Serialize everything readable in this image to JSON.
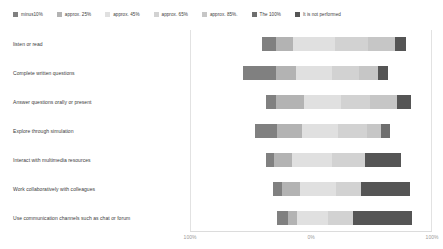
{
  "legend": {
    "items": [
      {
        "label": "minus10%",
        "color": "#808080"
      },
      {
        "label": "approx. 25%",
        "color": "#b3b3b3"
      },
      {
        "label": "approx. 45%",
        "color": "#e0e0e0"
      },
      {
        "label": "approx. 65%",
        "color": "#d2d2d2"
      },
      {
        "label": "approx. 85%.",
        "color": "#c6c6c6"
      },
      {
        "label": "The 100%",
        "color": "#6e6e6e"
      },
      {
        "label": "It is not performed",
        "color": "#555555"
      }
    ]
  },
  "axis": {
    "ticks": [
      {
        "label": "100%",
        "x": 190
      },
      {
        "label": "0%",
        "x": 311
      },
      {
        "label": "100%",
        "x": 432
      }
    ]
  },
  "chart_data": {
    "type": "bar",
    "subtype": "diverging-stacked-bar",
    "orientation": "horizontal",
    "title": "",
    "xlabel": "",
    "ylabel": "",
    "xlim": [
      -100,
      100
    ],
    "grid": false,
    "legend_position": "top",
    "categories": [
      "listen or read",
      "Complete written questions",
      "Answer questions orally or present",
      "Explore through simulation",
      "Interact with multimedia resources",
      "Work collaboratively with colleagues",
      "Use communication channels such as chat or forum"
    ],
    "series": [
      {
        "name": "minus10%",
        "color": "#808080",
        "values": [
          7,
          17,
          5,
          11,
          4,
          5,
          6
        ]
      },
      {
        "name": "approx. 25%",
        "color": "#b3b3b3",
        "values": [
          9,
          10,
          15,
          13,
          9,
          9,
          4
        ]
      },
      {
        "name": "approx. 45%",
        "color": "#e0e0e0",
        "values": [
          22,
          19,
          19,
          18,
          21,
          18,
          14
        ]
      },
      {
        "name": "approx. 65%",
        "color": "#d2d2d2",
        "values": [
          17,
          14,
          15,
          15,
          17,
          14,
          13
        ]
      },
      {
        "name": "approx. 85%.",
        "color": "#c6c6c6",
        "values": [
          14,
          10,
          14,
          12,
          13,
          10,
          10
        ]
      },
      {
        "name": "The 100%",
        "color": "#6e6e6e",
        "values": [
          5,
          5,
          7,
          3,
          0,
          0,
          0
        ]
      },
      {
        "name": "It is not performed",
        "color": "#555555",
        "values": [
          4,
          2,
          7,
          6,
          19,
          27,
          33
        ]
      }
    ],
    "rows": [
      {
        "category": "listen or read",
        "segments": [
          {
            "name": "minus10%",
            "color": "#808080",
            "width": 14
          },
          {
            "name": "approx. 25%",
            "color": "#b3b3b3",
            "width": 17
          },
          {
            "name": "approx. 45%",
            "color": "#e0e0e0",
            "width": 42
          },
          {
            "name": "approx. 65%",
            "color": "#d2d2d2",
            "width": 33
          },
          {
            "name": "approx. 85%.",
            "color": "#c6c6c6",
            "width": 27
          },
          {
            "name": "It is not performed",
            "color": "#555555",
            "width": 11
          }
        ],
        "offset": 72
      },
      {
        "category": "Complete written questions",
        "segments": [
          {
            "name": "minus10%",
            "color": "#808080",
            "width": 33
          },
          {
            "name": "approx. 25%",
            "color": "#b3b3b3",
            "width": 20
          },
          {
            "name": "approx. 45%",
            "color": "#e0e0e0",
            "width": 36
          },
          {
            "name": "approx. 65%",
            "color": "#d2d2d2",
            "width": 27
          },
          {
            "name": "approx. 85%.",
            "color": "#c6c6c6",
            "width": 19
          },
          {
            "name": "It is not performed",
            "color": "#555555",
            "width": 10
          }
        ],
        "offset": 53
      },
      {
        "category": "Answer questions orally or present",
        "segments": [
          {
            "name": "minus10%",
            "color": "#808080",
            "width": 10
          },
          {
            "name": "approx. 25%",
            "color": "#b3b3b3",
            "width": 28
          },
          {
            "name": "approx. 45%",
            "color": "#e0e0e0",
            "width": 37
          },
          {
            "name": "approx. 65%",
            "color": "#d2d2d2",
            "width": 29
          },
          {
            "name": "approx. 85%.",
            "color": "#c6c6c6",
            "width": 27
          },
          {
            "name": "It is not performed",
            "color": "#555555",
            "width": 14
          }
        ],
        "offset": 76
      },
      {
        "category": "Explore through simulation",
        "segments": [
          {
            "name": "minus10%",
            "color": "#808080",
            "width": 22
          },
          {
            "name": "approx. 25%",
            "color": "#b3b3b3",
            "width": 25
          },
          {
            "name": "approx. 45%",
            "color": "#e0e0e0",
            "width": 36
          },
          {
            "name": "approx. 65%",
            "color": "#d2d2d2",
            "width": 29
          },
          {
            "name": "approx. 85%.",
            "color": "#c6c6c6",
            "width": 14
          },
          {
            "name": "The 100%",
            "color": "#6e6e6e",
            "width": 9
          }
        ],
        "offset": 65
      },
      {
        "category": "Interact with multimedia resources",
        "segments": [
          {
            "name": "minus10%",
            "color": "#808080",
            "width": 8
          },
          {
            "name": "approx. 25%",
            "color": "#b3b3b3",
            "width": 18
          },
          {
            "name": "approx. 45%",
            "color": "#e0e0e0",
            "width": 40
          },
          {
            "name": "approx. 65%",
            "color": "#d2d2d2",
            "width": 33
          },
          {
            "name": "It is not performed",
            "color": "#555555",
            "width": 36
          }
        ],
        "offset": 76
      },
      {
        "category": "Work collaboratively with colleagues",
        "segments": [
          {
            "name": "minus10%",
            "color": "#808080",
            "width": 9
          },
          {
            "name": "approx. 25%",
            "color": "#b3b3b3",
            "width": 18
          },
          {
            "name": "approx. 45%",
            "color": "#e0e0e0",
            "width": 36
          },
          {
            "name": "approx. 65%",
            "color": "#d2d2d2",
            "width": 25
          },
          {
            "name": "It is not performed",
            "color": "#555555",
            "width": 49
          }
        ],
        "offset": 83
      },
      {
        "category": "Use communication channels such as chat or forum",
        "segments": [
          {
            "name": "minus10%",
            "color": "#808080",
            "width": 11
          },
          {
            "name": "approx. 25%",
            "color": "#b3b3b3",
            "width": 9
          },
          {
            "name": "approx. 45%",
            "color": "#e0e0e0",
            "width": 31
          },
          {
            "name": "approx. 65%",
            "color": "#d2d2d2",
            "width": 25
          },
          {
            "name": "It is not performed",
            "color": "#555555",
            "width": 59
          }
        ],
        "offset": 87
      }
    ]
  }
}
